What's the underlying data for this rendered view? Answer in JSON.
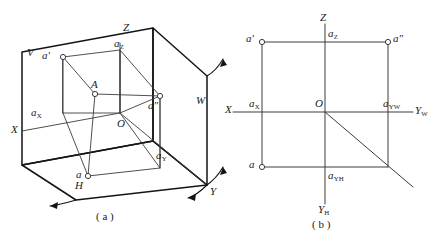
{
  "figure": {
    "title_absent": true,
    "panels": [
      {
        "id": "a",
        "caption": "( a )",
        "description_absent": true,
        "labels": {
          "plane_v": "V",
          "plane_h": "H",
          "plane_w": "W",
          "axis_x": "X",
          "axis_y": "Y",
          "axis_z": "Z",
          "origin": "O",
          "point_A": "A",
          "proj_front": "a′",
          "proj_side": "a″",
          "proj_top": "a",
          "coord_x_base": "a",
          "coord_x_sub": "X",
          "coord_y_base": "a",
          "coord_y_sub": "Y",
          "coord_z_base": "a",
          "coord_z_sub": "Z"
        }
      },
      {
        "id": "b",
        "caption": "( b )",
        "labels": {
          "axis_x": "X",
          "axis_z": "Z",
          "origin": "O",
          "axis_yw_base": "Y",
          "axis_yw_sub": "W",
          "axis_yh_base": "Y",
          "axis_yh_sub": "H",
          "proj_front": "a′",
          "proj_side": "a″",
          "proj_top": "a",
          "coord_x_base": "a",
          "coord_x_sub": "X",
          "coord_z_base": "a",
          "coord_z_sub": "Z",
          "coord_yw_base": "a",
          "coord_yw_sub": "YW",
          "coord_yh_base": "a",
          "coord_yh_sub": "YH"
        }
      }
    ]
  },
  "style": {
    "line_color": "#3c3c3c",
    "heavy_line_color": "#141414",
    "text_color": "#1a1a1a",
    "background": "#ffffff",
    "point_marker": "open-circle"
  },
  "geometry": {
    "panel_a": {
      "plane_v_outline": [
        [
          22,
          52
        ],
        [
          153,
          28
        ],
        [
          207,
          76
        ],
        [
          207,
          185
        ],
        [
          22,
          185
        ]
      ],
      "origin": [
        120,
        113
      ],
      "point_A": [
        95,
        94
      ],
      "a_front": [
        63,
        57
      ],
      "a_side": [
        160,
        96
      ],
      "a_top": [
        88,
        176
      ],
      "a_x": [
        63,
        113
      ],
      "a_y": [
        160,
        155
      ],
      "a_z": [
        120,
        57
      ]
    },
    "panel_b": {
      "origin": [
        325,
        112
      ],
      "a_front": [
        262,
        42
      ],
      "a_side": [
        388,
        42
      ],
      "a_top": [
        262,
        167
      ],
      "a_x": [
        262,
        112
      ],
      "a_z": [
        325,
        42
      ],
      "a_yw": [
        388,
        112
      ],
      "a_yh": [
        325,
        167
      ],
      "diagonal_end": [
        413,
        187
      ]
    }
  }
}
